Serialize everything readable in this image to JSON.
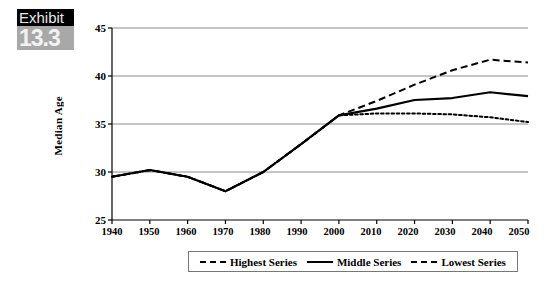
{
  "exhibit": {
    "word": "Exhibit",
    "number": "13.3"
  },
  "chart_data": {
    "type": "line",
    "title": "",
    "xlabel": "",
    "ylabel": "Median Age",
    "xlim": [
      1940,
      2050
    ],
    "ylim": [
      25,
      45
    ],
    "yticks": [
      25,
      30,
      35,
      40,
      45
    ],
    "grid": "horizontal",
    "legend_position": "bottom",
    "x": [
      1940,
      1950,
      1960,
      1970,
      1980,
      1990,
      2000,
      2010,
      2020,
      2030,
      2040,
      2050
    ],
    "series": [
      {
        "name": "Highest Series",
        "style": "dashed",
        "values": [
          29.5,
          30.2,
          29.5,
          28.0,
          30.0,
          32.9,
          35.9,
          37.4,
          39.1,
          40.6,
          41.7,
          41.4
        ]
      },
      {
        "name": "Middle Series",
        "style": "solid",
        "values": [
          29.5,
          30.2,
          29.5,
          28.0,
          30.0,
          32.9,
          35.9,
          36.6,
          37.5,
          37.7,
          38.3,
          37.9
        ]
      },
      {
        "name": "Lowest Series",
        "style": "dash-dot",
        "values": [
          29.5,
          30.2,
          29.5,
          28.0,
          30.0,
          32.9,
          35.9,
          36.1,
          36.1,
          36.0,
          35.7,
          35.2
        ]
      }
    ]
  },
  "axis": {
    "ytick_labels": [
      "45",
      "40",
      "35",
      "30",
      "25"
    ],
    "xtick_labels": [
      "1940",
      "1950",
      "1960",
      "1970",
      "1980",
      "1990",
      "2000",
      "2010",
      "2020",
      "2030",
      "2040",
      "2050"
    ]
  },
  "legend": {
    "entries": [
      {
        "label": "Highest Series"
      },
      {
        "label": "Middle Series"
      },
      {
        "label": "Lowest Series"
      }
    ]
  },
  "colors": {
    "line": "#000000",
    "grid": "#808080",
    "axis": "#000000",
    "badge_dark": "#000000",
    "badge_gray": "#a8a8a8"
  }
}
